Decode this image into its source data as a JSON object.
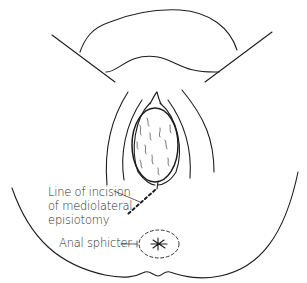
{
  "diagram": {
    "title": "Mediolateral episiotomy",
    "labels": {
      "incision": [
        "Line of incision",
        "of mediolateral",
        "episiotomy"
      ],
      "anal_sphincter": "Anal sphicter"
    },
    "stroke_color": "#1e1e1e",
    "background": "#ffffff"
  }
}
